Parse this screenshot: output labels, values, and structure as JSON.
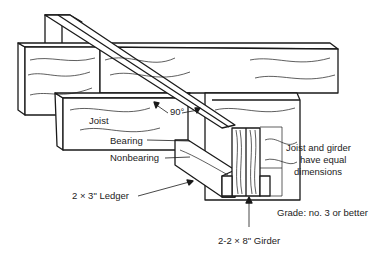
{
  "diagram": {
    "type": "technical-illustration",
    "labels": {
      "joist": "Joist",
      "angle": "90°",
      "bearing": "Bearing",
      "nonbearing": "Nonbearing",
      "ledger": "2 × 3\" Ledger",
      "girder": "2-2 × 8\" Girder",
      "equal_line1": "Joist and girder",
      "equal_line2": "have equal",
      "equal_line3": "dimensions",
      "grade": "Grade: no. 3 or better"
    },
    "colors": {
      "line": "#1a1a1a",
      "background": "#ffffff",
      "text": "#222222"
    }
  }
}
